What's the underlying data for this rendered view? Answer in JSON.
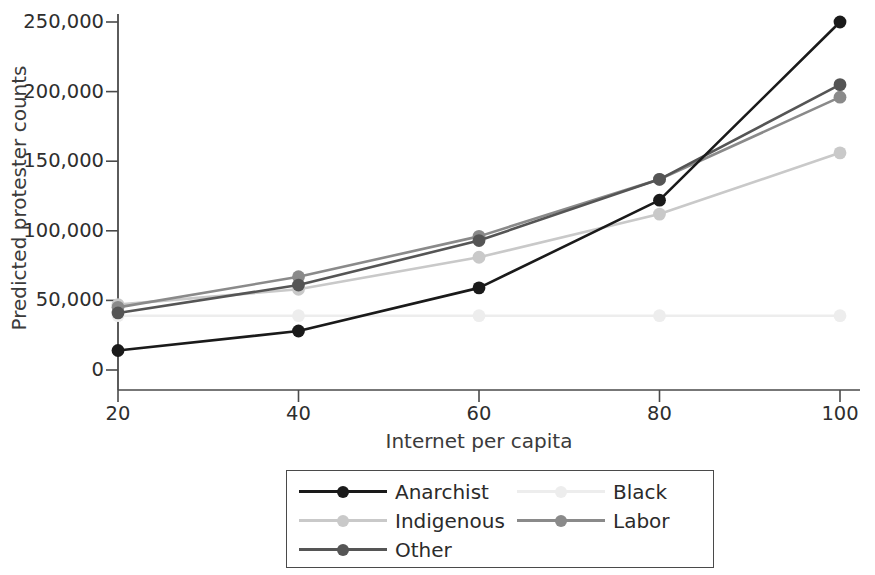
{
  "chart_data": {
    "type": "line",
    "title": "",
    "xlabel": "Internet per capita",
    "ylabel": "Predicted protester counts",
    "x": [
      20,
      40,
      60,
      80,
      100
    ],
    "xticklabels": [
      "20",
      "40",
      "60",
      "80",
      "100"
    ],
    "yticklabels": [
      "0",
      "50,000",
      "100,000",
      "150,000",
      "200,000",
      "250,000"
    ],
    "yticks": [
      0,
      50000,
      100000,
      150000,
      200000,
      250000
    ],
    "xlim": [
      14,
      106
    ],
    "ylim": [
      0,
      262000
    ],
    "grid": false,
    "legend_position": "below-axes",
    "series": [
      {
        "name": "Anarchist",
        "color": "#1a1a1a",
        "values": [
          14000,
          28000,
          59000,
          122000,
          250000
        ]
      },
      {
        "name": "Black",
        "color": "#ededed",
        "values": [
          39000,
          39000,
          39000,
          39000,
          39000
        ]
      },
      {
        "name": "Indigenous",
        "color": "#c9c9c9",
        "values": [
          47000,
          58000,
          81000,
          112000,
          156000
        ]
      },
      {
        "name": "Labor",
        "color": "#8a8a8a",
        "values": [
          45000,
          67000,
          96000,
          137000,
          196000
        ]
      },
      {
        "name": "Other",
        "color": "#555555",
        "values": [
          41000,
          61000,
          93000,
          137000,
          205000
        ]
      }
    ]
  },
  "axes": {
    "y_title": "Predicted protester counts",
    "x_title": "Internet per capita",
    "y_tick_labels": [
      "250,000",
      "200,000",
      "150,000",
      "100,000",
      "50,000",
      "0"
    ],
    "x_tick_labels": [
      "20",
      "40",
      "60",
      "80",
      "100"
    ],
    "axis_color": "#4a4a4a"
  },
  "legend": {
    "entries": [
      {
        "label": "Anarchist",
        "color": "#1a1a1a",
        "has_marker": true
      },
      {
        "label": "Black",
        "color": "#ededed",
        "has_marker": true
      },
      {
        "label": "Indigenous",
        "color": "#c9c9c9",
        "has_marker": true
      },
      {
        "label": "Labor",
        "color": "#8a8a8a",
        "has_marker": true
      },
      {
        "label": "Other",
        "color": "#555555",
        "has_marker": true
      }
    ]
  }
}
